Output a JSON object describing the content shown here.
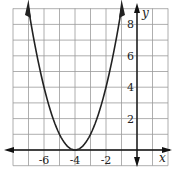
{
  "chart_data": {
    "type": "line",
    "title": "",
    "xlabel": "x",
    "ylabel": "y",
    "equation": "y = (x + 4)^2",
    "vertex": [
      -4,
      0
    ],
    "xlim": [
      -8,
      2
    ],
    "ylim": [
      -1,
      9
    ],
    "grid": true,
    "x_ticks": [
      -6,
      -4,
      -2
    ],
    "y_ticks": [
      2,
      4,
      6,
      8
    ],
    "x_tick_labels": [
      "-6",
      "-4",
      "-2"
    ],
    "y_tick_labels": [
      "2",
      "4",
      "6",
      "8"
    ],
    "series": [
      {
        "name": "parabola",
        "x": [
          -7,
          -6.5,
          -6,
          -5.5,
          -5,
          -4.5,
          -4,
          -3.5,
          -3,
          -2.5,
          -2,
          -1.5,
          -1
        ],
        "values": [
          9,
          6.25,
          4,
          2.25,
          1,
          0.25,
          0,
          0.25,
          1,
          2.25,
          4,
          6.25,
          9
        ]
      }
    ],
    "colors": {
      "grid": "#9a9a9a",
      "axis": "#111111",
      "curve": "#222222",
      "background": "#ffffff"
    }
  }
}
